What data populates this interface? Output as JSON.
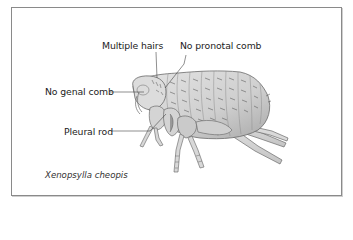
{
  "figure": {
    "species_caption": "Xenopsylla cheopis",
    "labels": [
      {
        "id": "multiple-hairs",
        "text": "Multiple hairs"
      },
      {
        "id": "no-pronotal-comb",
        "text": "No pronotal comb"
      },
      {
        "id": "no-genal-comb",
        "text": "No genal comb"
      },
      {
        "id": "pleural-rod",
        "text": "Pleural rod"
      }
    ],
    "colors": {
      "frame": "#8a8a8a",
      "body_fill": "#d6d6d6",
      "body_shade": "#b9b9b9",
      "outline": "#6a6a6a",
      "text": "#222222"
    }
  }
}
